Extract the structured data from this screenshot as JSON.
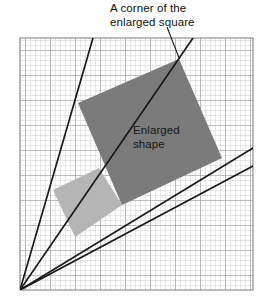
{
  "figure": {
    "type": "geometry-diagram",
    "background_color": "#ffffff",
    "labels": {
      "callout": {
        "line1": "A corner of the",
        "line2": "enlarged square"
      },
      "shape": {
        "line1": "Enlarged",
        "line2": "shape"
      }
    },
    "grid": {
      "x": 20,
      "y": 38,
      "width": 233,
      "height": 252,
      "minor_spacing": 5,
      "major_spacing": 25,
      "minor_color": "#c9c9c9",
      "major_color": "#8f8f8f",
      "border_color": "#8f8f8f"
    },
    "centre_of_enlargement": {
      "x": 20,
      "y": 290
    },
    "rays": [
      {
        "name": "ray-1",
        "x1": 20,
        "y1": 290,
        "x2": 93,
        "y2": 38
      },
      {
        "name": "ray-2",
        "x1": 20,
        "y1": 290,
        "x2": 193,
        "y2": 38
      },
      {
        "name": "ray-3",
        "x1": 20,
        "y1": 290,
        "x2": 253,
        "y2": 148
      },
      {
        "name": "ray-4",
        "x1": 20,
        "y1": 290,
        "x2": 253,
        "y2": 166
      },
      {
        "name": "leader-line",
        "x1": 167,
        "y1": 27,
        "x2": 179,
        "y2": 59
      }
    ],
    "ray_color": "#1a1a1a",
    "original_square": {
      "name": "original-shape",
      "fill": "#b5b5b5",
      "points": "99,168 122,205 75,237 53,190"
    },
    "enlarged_square": {
      "name": "enlarged-shape",
      "fill": "#7b7b7b",
      "points": "179,59 222,158 122,205 78,103"
    }
  }
}
